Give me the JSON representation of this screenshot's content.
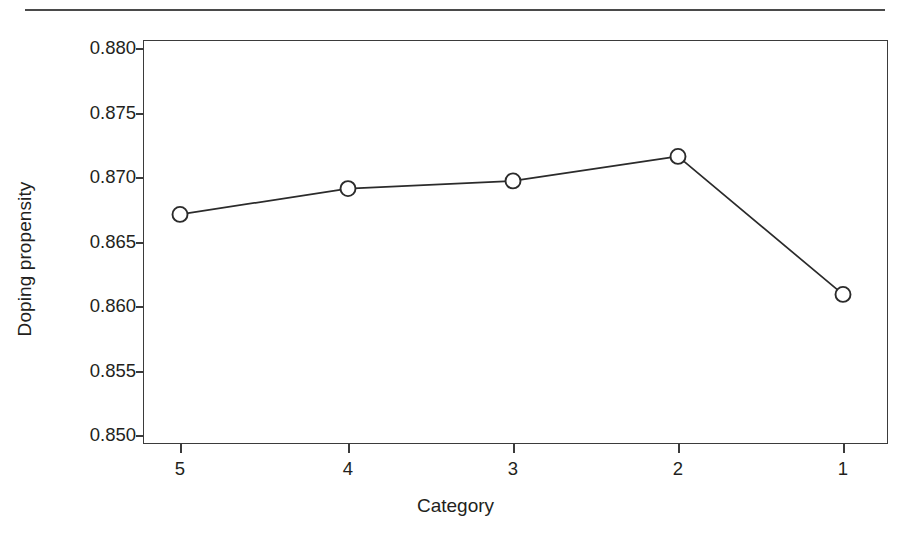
{
  "figure": {
    "top_rule_present": true,
    "background_color": "#ffffff",
    "line_color": "#2b2b2b",
    "axis_color": "#3b3b3b",
    "text_color": "#231f20"
  },
  "axes": {
    "y_title": "Doping propensity",
    "x_title": "Category",
    "y_tick_labels": [
      "0.880",
      "0.875",
      "0.870",
      "0.865",
      "0.860",
      "0.855",
      "0.850"
    ],
    "x_tick_labels": [
      "5",
      "4",
      "3",
      "2",
      "1"
    ]
  },
  "chart_data": {
    "type": "line",
    "title": "",
    "xlabel": "Category",
    "ylabel": "Doping propensity",
    "categories": [
      "5",
      "4",
      "3",
      "2",
      "1"
    ],
    "values": [
      0.8671,
      0.8691,
      0.8697,
      0.8716,
      0.8609
    ],
    "series": [
      {
        "name": "Doping propensity",
        "values": [
          0.8671,
          0.8691,
          0.8697,
          0.8716,
          0.8609
        ],
        "marker": "open-circle",
        "line_style": "solid",
        "color": "#2b2b2b"
      }
    ],
    "ylim": [
      0.8485,
      0.8815
    ],
    "y_ticks": [
      0.85,
      0.855,
      0.86,
      0.865,
      0.87,
      0.875,
      0.88
    ],
    "grid": false,
    "legend": false,
    "legend_position": "none"
  }
}
